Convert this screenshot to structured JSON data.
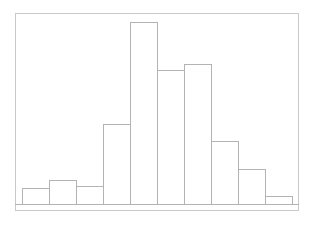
{
  "chart_data": {
    "type": "bar",
    "title": "",
    "subtitle": "",
    "xlabel": "",
    "ylabel": "",
    "categories": [
      "1",
      "2",
      "3",
      "4",
      "5",
      "6",
      "7",
      "8",
      "9",
      "10"
    ],
    "values": [
      16,
      24,
      18,
      80,
      182,
      134,
      140,
      63,
      35,
      8
    ],
    "bin_edges": [
      0,
      1,
      2,
      3,
      4,
      5,
      6,
      7,
      8,
      9,
      10
    ],
    "xlim": [
      0,
      10
    ],
    "ylim": [
      0,
      191
    ],
    "grid": false,
    "legend": null,
    "tick_labels_x": [],
    "tick_labels_y": [],
    "annotations": [],
    "series": [
      {
        "name": "frequency",
        "values": [
          16,
          24,
          18,
          80,
          182,
          134,
          140,
          63,
          35,
          8
        ]
      }
    ]
  },
  "figure": {
    "background_color": "#ffffff",
    "frame_color": "#c9c9c9",
    "bar_edge_color": "#b3b3b3",
    "bar_fill_color": "#ffffff",
    "baseline_color": "#b3b3b3"
  },
  "geometry": {
    "frame": {
      "x": 15,
      "y": 13,
      "width": 284,
      "height": 198
    },
    "baseline_y": 204,
    "bar_origin_x": 22,
    "bar_width": 27,
    "bar_tops": [
      188,
      180,
      186,
      124,
      22,
      70,
      64,
      141,
      169,
      196
    ]
  }
}
